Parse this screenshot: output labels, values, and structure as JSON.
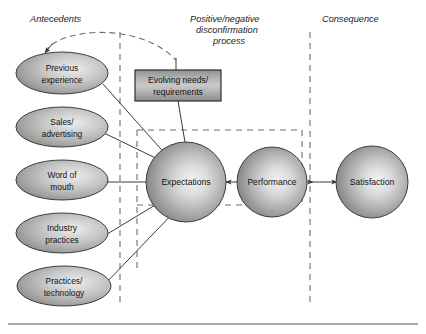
{
  "figure": {
    "background_color": "#ffffff"
  },
  "columns": [
    {
      "id": "antecedents",
      "label": "Antecedents"
    },
    {
      "id": "disconfirmation",
      "label_line1": "Positive/negative",
      "label_line2": "disconfirmation",
      "label_line3": "process"
    },
    {
      "id": "consequence",
      "label": "Consequence"
    }
  ],
  "antecedent_nodes": [
    {
      "id": "previous-experience",
      "line1": "Previous",
      "line2": "experience"
    },
    {
      "id": "sales-advertising",
      "line1": "Sales/",
      "line2": "advertising"
    },
    {
      "id": "word-of-mouth",
      "line1": "Word of",
      "line2": "mouth"
    },
    {
      "id": "industry-practices",
      "line1": "Industry",
      "line2": "practices"
    },
    {
      "id": "practices-technology",
      "line1": "Practices/",
      "line2": "technology"
    }
  ],
  "process_box": {
    "id": "evolving-needs",
    "line1": "Evolving needs/",
    "line2": "requirements"
  },
  "circle_nodes": [
    {
      "id": "expectations",
      "label": "Expectations"
    },
    {
      "id": "performance",
      "label": "Performance"
    },
    {
      "id": "satisfaction",
      "label": "Satisfaction"
    }
  ],
  "colors": {
    "shape_fill_light": "#e8e8e8",
    "shape_fill_mid": "#b4b4b4",
    "shape_fill_dark": "#7c7c7c",
    "outline": "#3d3d3d",
    "arrow": "#3b3b3b",
    "dashed": "#6d6d6d",
    "text": "#111111",
    "frame": "#555555"
  }
}
